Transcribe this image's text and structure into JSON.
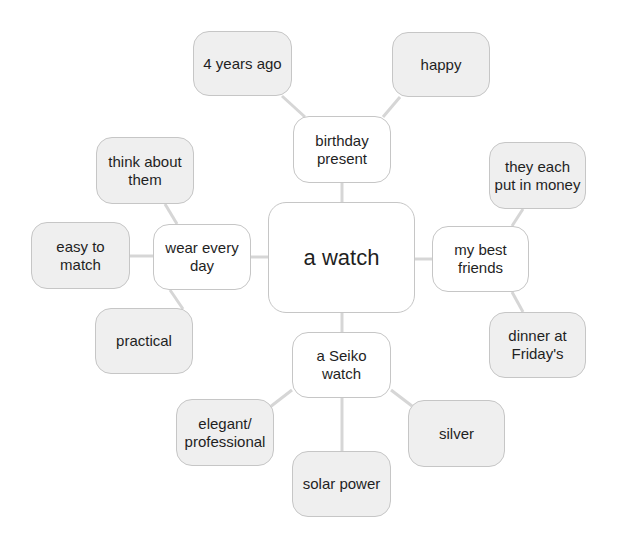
{
  "diagram": {
    "type": "mind-map",
    "colors": {
      "background": "#ffffff",
      "primary_fill": "#ffffff",
      "secondary_fill": "#efefef",
      "border": "#c6c6c6",
      "connector": "#d6d6d6",
      "text": "#1f1f1f"
    },
    "central": {
      "label": "a watch"
    },
    "branches": [
      {
        "label": "birthday present",
        "children": [
          {
            "label": "4 years ago"
          },
          {
            "label": "happy"
          }
        ]
      },
      {
        "label": "wear every day",
        "children": [
          {
            "label": "think about them"
          },
          {
            "label": "easy to match"
          },
          {
            "label": "practical"
          }
        ]
      },
      {
        "label": "my best friends",
        "children": [
          {
            "label": "they each put in money"
          },
          {
            "label": "dinner at Friday's"
          }
        ]
      },
      {
        "label": "a Seiko watch",
        "children": [
          {
            "label": "elegant/ professional"
          },
          {
            "label": "solar power"
          },
          {
            "label": "silver"
          }
        ]
      }
    ]
  }
}
